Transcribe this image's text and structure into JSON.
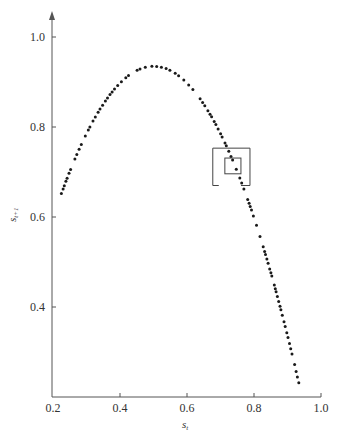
{
  "chart_data": {
    "type": "scatter",
    "title": "",
    "xlabel": "s_t",
    "ylabel": "s_{t+1}",
    "xlim": [
      0.2,
      1.0
    ],
    "ylim": [
      0.2,
      1.0
    ],
    "x_ticks": [
      "0.2",
      "0.4",
      "0.6",
      "0.8",
      "1.0"
    ],
    "y_ticks": [
      "0.4",
      "0.6",
      "0.8",
      "1.0"
    ],
    "grid": false,
    "legend": null,
    "model": {
      "r": 3.74
    },
    "x_range_of_points": [
      0.225,
      0.934
    ],
    "peak": {
      "x": 0.5,
      "y": 0.935
    },
    "sample_points": [
      {
        "x": 0.225,
        "y": 0.652
      },
      {
        "x": 0.3,
        "y": 0.785
      },
      {
        "x": 0.4,
        "y": 0.898
      },
      {
        "x": 0.5,
        "y": 0.935
      },
      {
        "x": 0.6,
        "y": 0.898
      },
      {
        "x": 0.7,
        "y": 0.785
      },
      {
        "x": 0.73,
        "y": 0.737
      },
      {
        "x": 0.8,
        "y": 0.598
      },
      {
        "x": 0.87,
        "y": 0.423
      },
      {
        "x": 0.934,
        "y": 0.231
      }
    ],
    "annotations": [
      {
        "type": "rectangle",
        "name": "outer-box",
        "x0": 0.677,
        "x1": 0.788,
        "y0": 0.67,
        "y1": 0.753,
        "bottom_edge": "broken"
      },
      {
        "type": "rectangle",
        "name": "inner-box",
        "x0": 0.713,
        "x1": 0.761,
        "y0": 0.696,
        "y1": 0.731
      }
    ]
  },
  "axes": {
    "x_label_main": "s",
    "x_label_sub": "t",
    "y_label_main": "s",
    "y_label_sub": "t+1"
  },
  "colors": {
    "points": "#1a1a1a",
    "axes": "#555555",
    "boxes": "#444444",
    "background": "#ffffff"
  }
}
